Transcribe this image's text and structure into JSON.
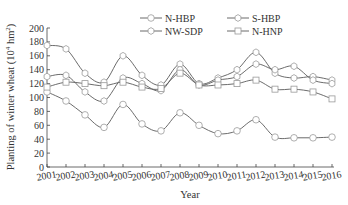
{
  "chart_data": {
    "type": "line",
    "title": "",
    "xlabel": "Year",
    "ylabel": "Planting of winter wheat (10⁴ hm²)",
    "ylabel_main": "Planting of winter wheat (10",
    "ylabel_exp": "4",
    "ylabel_unit": " hm",
    "ylabel_unit_exp": "2",
    "ylabel_close": ")",
    "ylim": [
      0,
      200
    ],
    "yticks": [
      0,
      20,
      40,
      60,
      80,
      100,
      120,
      140,
      160,
      180,
      200
    ],
    "x": [
      "2001",
      "2002",
      "2003",
      "2004",
      "2005",
      "2006",
      "2007",
      "2008",
      "2009",
      "2010",
      "2011",
      "2012",
      "2013",
      "2014",
      "2015",
      "2016"
    ],
    "grid": false,
    "legend_position": "top-center",
    "series": [
      {
        "name": "N-HBP",
        "marker": "circle",
        "values": [
          108,
          95,
          75,
          57,
          90,
          62,
          52,
          78,
          60,
          48,
          52,
          68,
          43,
          42,
          42,
          43
        ]
      },
      {
        "name": "S-HBP",
        "marker": "hexagon",
        "values": [
          175,
          170,
          135,
          122,
          160,
          132,
          118,
          148,
          120,
          128,
          140,
          165,
          135,
          128,
          130,
          125
        ]
      },
      {
        "name": "NW-SDP",
        "marker": "hexagon",
        "values": [
          130,
          132,
          108,
          95,
          128,
          120,
          110,
          140,
          118,
          125,
          130,
          148,
          140,
          145,
          125,
          120
        ]
      },
      {
        "name": "N-HNP",
        "marker": "square",
        "values": [
          115,
          122,
          120,
          117,
          122,
          115,
          113,
          135,
          118,
          118,
          120,
          125,
          112,
          112,
          108,
          98
        ]
      }
    ]
  },
  "legend": {
    "items": [
      {
        "label": "N-HBP",
        "marker": "circle"
      },
      {
        "label": "S-HBP",
        "marker": "hexagon"
      },
      {
        "label": "NW-SDP",
        "marker": "hexagon"
      },
      {
        "label": "N-HNP",
        "marker": "square"
      }
    ]
  },
  "colors": {
    "line": "#5a5a5a",
    "marker_fill": "#ffffff",
    "marker_stroke": "#9a9a9a",
    "axis": "#444444"
  }
}
